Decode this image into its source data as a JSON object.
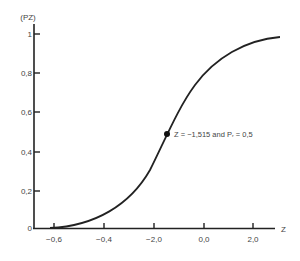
{
  "chart_data": {
    "type": "line",
    "title": "",
    "xlabel": "Z",
    "ylabel": "(PZ)",
    "x_tick_labels": [
      "-0,6",
      "-0,4",
      "-2,0",
      "0,0",
      "2,0"
    ],
    "y_tick_labels": [
      "0",
      "0,2",
      "0,4",
      "0,6",
      "0,8",
      "1"
    ],
    "ylim": [
      0,
      1
    ],
    "grid": false,
    "legend": null,
    "series": [
      {
        "name": "cumulative probability curve",
        "points_px": [
          [
            50,
            228
          ],
          [
            70,
            226
          ],
          [
            90,
            220
          ],
          [
            110,
            209
          ],
          [
            130,
            193
          ],
          [
            150,
            169
          ],
          [
            167,
            134
          ],
          [
            185,
            98
          ],
          [
            205,
            71
          ],
          [
            225,
            54
          ],
          [
            245,
            44
          ],
          [
            265,
            38
          ],
          [
            280,
            37
          ]
        ]
      }
    ],
    "annotations": [
      {
        "text": "Z = −1,515 and Pᵣ = 0,5",
        "point": {
          "z": -1.515,
          "p": 0.5
        }
      }
    ]
  },
  "axes": {
    "y_label": "(PZ)",
    "x_label": "Z",
    "y_ticks": [
      {
        "label": "1",
        "y": 34
      },
      {
        "label": "0,8",
        "y": 73
      },
      {
        "label": "0,6",
        "y": 112
      },
      {
        "label": "0,4",
        "y": 152
      },
      {
        "label": "0,2",
        "y": 191
      },
      {
        "label": "0",
        "y": 228
      }
    ],
    "x_ticks": [
      {
        "label": "-0,6",
        "x": 54
      },
      {
        "label": "-0,4",
        "x": 104
      },
      {
        "label": "-2,0",
        "x": 154
      },
      {
        "label": "0,0",
        "x": 204
      },
      {
        "label": "2,0",
        "x": 253
      }
    ]
  },
  "annotation": {
    "text": "Z = −1,515 and Pᵣ = 0,5"
  },
  "colors": {
    "line": "#222222",
    "text": "#444444",
    "background": "#ffffff"
  }
}
